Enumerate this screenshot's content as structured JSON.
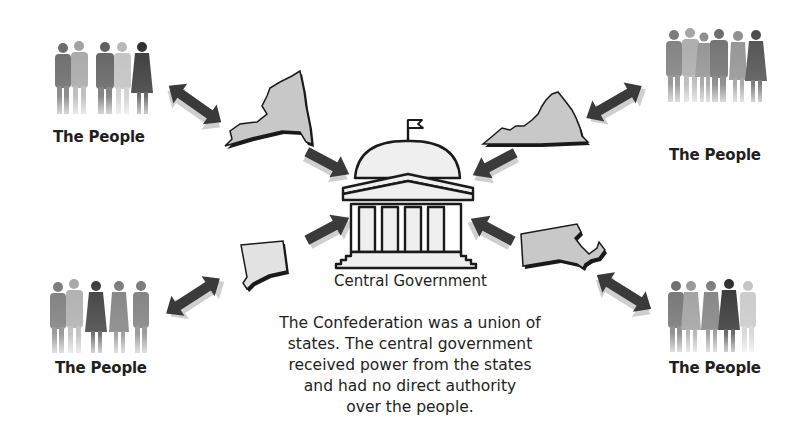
{
  "diagram": {
    "center": {
      "label": "Central Government",
      "icon": "capitol-building-icon"
    },
    "groups": [
      {
        "id": "top-left",
        "label": "The People",
        "figures": 5,
        "state": "New York"
      },
      {
        "id": "top-right",
        "label": "The People",
        "figures": 6,
        "state": "Virginia"
      },
      {
        "id": "bottom-left",
        "label": "The People",
        "figures": 5,
        "state": "Connecticut"
      },
      {
        "id": "bottom-right",
        "label": "The People",
        "figures": 5,
        "state": "Massachusetts"
      }
    ],
    "relations": {
      "people_to_state": "two-way arrow",
      "state_to_center": "one-way arrow toward Central Government"
    },
    "caption_lines": [
      "The Confederation was a union of",
      "states. The central government",
      "received power from the states",
      "and had no direct authority",
      "over the people."
    ]
  },
  "colors": {
    "text": "#231f20",
    "state_fill": "#c8c8c8",
    "state_outline": "#1a1a1a",
    "arrow": "#3a3a3a",
    "arrow_shadow": "#bdbdbd",
    "building_fill": "#efefef",
    "building_outline": "#1a1a1a"
  }
}
